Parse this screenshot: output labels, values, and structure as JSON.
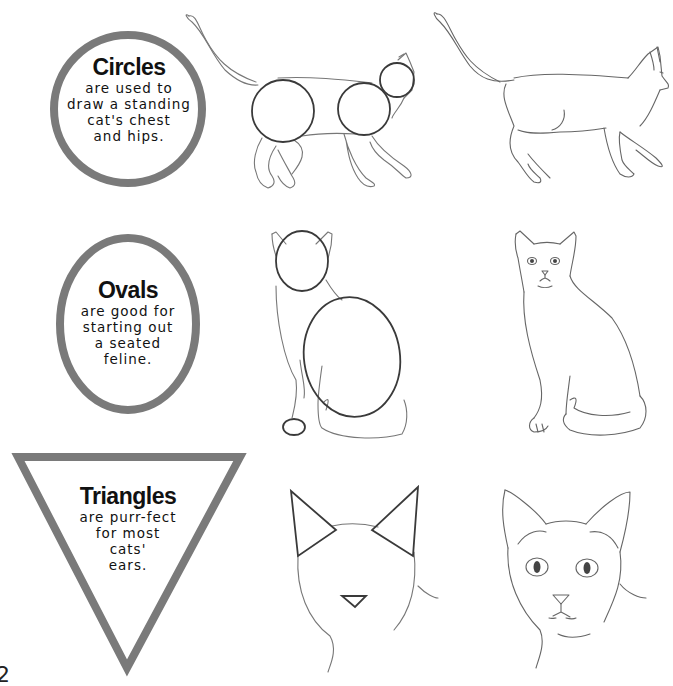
{
  "page": {
    "page_number": "2",
    "ring_color": "#7a7a7a",
    "sketch_color": "#555555",
    "construction_color": "#3a3a3a"
  },
  "sections": [
    {
      "shape": "circle",
      "title": "Circles",
      "lines": [
        "are used to",
        "draw a standing",
        "cat's chest",
        "and hips."
      ],
      "construction_drawing": "standing-cat-with-construction-circles",
      "finished_drawing": "standing-cat-finished"
    },
    {
      "shape": "oval",
      "title": "Ovals",
      "lines": [
        "are good for",
        "starting out",
        "a seated",
        "feline."
      ],
      "construction_drawing": "seated-cat-with-construction-ovals",
      "finished_drawing": "seated-cat-finished"
    },
    {
      "shape": "triangle",
      "title": "Triangles",
      "lines": [
        "are purr-fect",
        "for most",
        "cats'",
        "ears."
      ],
      "construction_drawing": "cat-head-with-triangle-ears",
      "finished_drawing": "cat-head-finished"
    }
  ]
}
